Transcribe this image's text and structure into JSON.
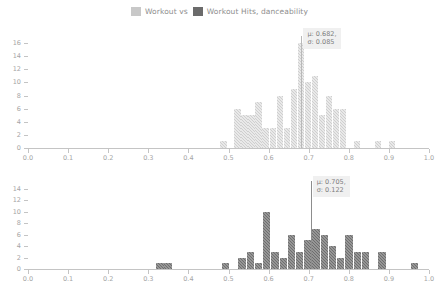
{
  "legend": {
    "entries": [
      {
        "label": "Workout vs",
        "swatch": "light",
        "color": "#c8c8c8"
      },
      {
        "label": "Workout Hits, danceability",
        "swatch": "dark",
        "color": "#6b6b6b"
      }
    ]
  },
  "chart_data": [
    {
      "id": "top",
      "type": "bar",
      "title": "Workout vs",
      "xlabel": "",
      "ylabel": "",
      "xlim": [
        0.0,
        1.0
      ],
      "ylim": [
        0,
        16
      ],
      "grid": false,
      "legend_position": "top-center",
      "bar_color": "#cfcfcf",
      "xticks": [
        "0.0",
        "0.1",
        "0.2",
        "0.3",
        "0.4",
        "0.5",
        "0.6",
        "0.7",
        "0.8",
        "0.9",
        "1.0"
      ],
      "xtick_values": [
        0.0,
        0.1,
        0.2,
        0.3,
        0.4,
        0.5,
        0.6,
        0.7,
        0.8,
        0.9,
        1.0
      ],
      "yticks": [
        "0",
        "2",
        "4",
        "6",
        "8",
        "10",
        "12",
        "14",
        "16"
      ],
      "ytick_values": [
        0,
        2,
        4,
        6,
        8,
        10,
        12,
        14,
        16
      ],
      "bin_width": 0.0175,
      "x": [
        0.4875,
        0.5225,
        0.54,
        0.5575,
        0.575,
        0.5925,
        0.61,
        0.6275,
        0.645,
        0.6625,
        0.68,
        0.6975,
        0.715,
        0.7325,
        0.75,
        0.7675,
        0.785,
        0.82,
        0.8725,
        0.9075
      ],
      "values": [
        1,
        6,
        5,
        5,
        7,
        3,
        3,
        8,
        3,
        9,
        16,
        10,
        11,
        5,
        8,
        6,
        6,
        1,
        1,
        1
      ],
      "annotation": {
        "mu_label": "μ: 0.682,",
        "sigma_label": "σ: 0.085",
        "mu": 0.682,
        "sigma": 0.085
      }
    },
    {
      "id": "bottom",
      "type": "bar",
      "title": "Workout Hits, danceability",
      "xlabel": "",
      "ylabel": "",
      "xlim": [
        0.0,
        1.0
      ],
      "ylim": [
        0,
        14
      ],
      "grid": false,
      "legend_position": "top-center",
      "bar_color": "#6e6e6e",
      "xticks": [
        "0.0",
        "0.1",
        "0.2",
        "0.3",
        "0.4",
        "0.5",
        "0.6",
        "0.7",
        "0.8",
        "0.9",
        "1.0"
      ],
      "xtick_values": [
        0.0,
        0.1,
        0.2,
        0.3,
        0.4,
        0.5,
        0.6,
        0.7,
        0.8,
        0.9,
        1.0
      ],
      "yticks": [
        "0",
        "2",
        "4",
        "6",
        "8",
        "10",
        "12",
        "14"
      ],
      "ytick_values": [
        0,
        2,
        4,
        6,
        8,
        10,
        12,
        14
      ],
      "bin_width": 0.0205,
      "x": [
        0.329,
        0.3495,
        0.493,
        0.534,
        0.5545,
        0.575,
        0.5955,
        0.616,
        0.6365,
        0.657,
        0.6775,
        0.698,
        0.7185,
        0.739,
        0.7595,
        0.78,
        0.8005,
        0.821,
        0.8415,
        0.8825,
        0.9645
      ],
      "values": [
        1,
        1,
        1,
        2,
        3,
        1,
        10,
        3,
        2,
        6,
        3,
        5,
        7,
        6,
        4,
        2,
        6,
        3,
        3,
        3,
        1
      ],
      "annotation": {
        "mu_label": "μ: 0.705,",
        "sigma_label": "σ: 0.122",
        "mu": 0.705,
        "sigma": 0.122
      }
    }
  ]
}
